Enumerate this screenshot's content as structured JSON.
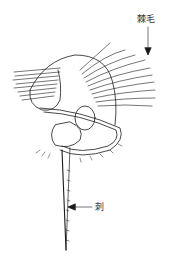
{
  "figure": {
    "labels": {
      "cirri": "棘毛",
      "spine": "刺"
    },
    "colors": {
      "line": "#1a1a1a",
      "label": "#333333",
      "background": "#ffffff"
    }
  }
}
